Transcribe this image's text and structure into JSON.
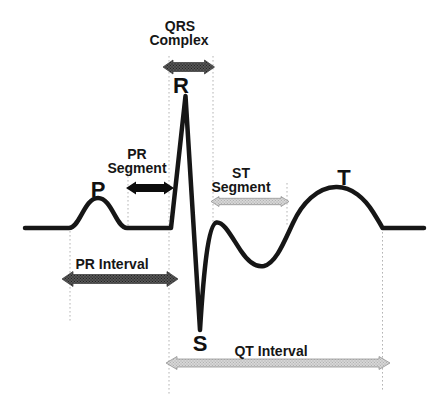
{
  "figure": {
    "type": "ecg-pqrst-diagram",
    "background": "#ffffff",
    "waveform_color": "#161616",
    "guide_line_color": "#b4b4b4",
    "wave_labels": {
      "p": "P",
      "r": "R",
      "s": "S",
      "t": "T"
    },
    "annotations": {
      "qrs_complex": {
        "line1": "QRS",
        "line2": "Complex",
        "arrow_style": "dark-stippled-double-arrow",
        "color": "#4f4f4f"
      },
      "pr_segment": {
        "line1": "PR",
        "line2": "Segment",
        "arrow_style": "solid-black-double-arrow",
        "color": "#0d0d0d"
      },
      "st_segment": {
        "line1": "ST",
        "line2": "Segment",
        "arrow_style": "light-stippled-double-arrow",
        "color": "#d2d2d2"
      },
      "pr_interval": {
        "label": "PR Interval",
        "arrow_style": "dark-stippled-double-arrow",
        "color": "#4f4f4f"
      },
      "qt_interval": {
        "label": "QT Interval",
        "arrow_style": "light-stippled-double-arrow",
        "color": "#d2d2d2"
      }
    }
  }
}
